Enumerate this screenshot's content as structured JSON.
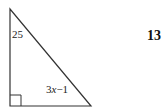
{
  "problem": {
    "number": "13"
  },
  "figure": {
    "type": "right-triangle",
    "angle_label": "25",
    "side_label_prefix": "3",
    "side_label_var": "x",
    "side_label_suffix": "−1",
    "side_label_full": "3x−1",
    "right_angle_marker": true,
    "stroke_color": "#333333"
  }
}
